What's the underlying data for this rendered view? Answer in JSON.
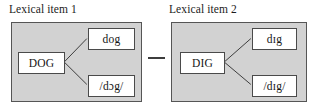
{
  "figure": {
    "type": "diagram",
    "background_color": "#ffffff",
    "panel_fill_color": "#d2d2d2",
    "panel_border_color": "#555555",
    "node_fill_color": "#ffffff",
    "node_border_color": "#4a4a4a",
    "connector_color": "#3a3a3a",
    "text_color": "#151515",
    "separator": "—"
  },
  "panels": [
    {
      "caption": "Lexical item 1",
      "lemma": "DOG",
      "orthographic": "dog",
      "phonological": "/dɔg/"
    },
    {
      "caption": "Lexical item 2",
      "lemma": "DIG",
      "orthographic": "dɪg",
      "phonological": "/dɪg/"
    }
  ]
}
